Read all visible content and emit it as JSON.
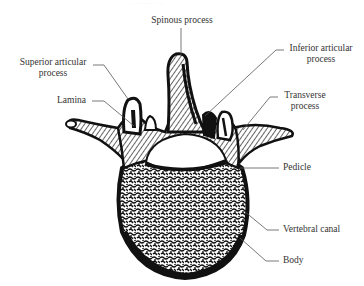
{
  "figure": {
    "faint_caption": "· · · · · · · · · · · ·",
    "labels": {
      "spinous_process": "Spinous process",
      "superior_articular_line1": "Superior articular",
      "superior_articular_line2": "process",
      "lamina": "Lamina",
      "inferior_articular_line1": "Inferior articular",
      "inferior_articular_line2": "process",
      "transverse_line1": "Transverse",
      "transverse_line2": "process",
      "pedicle": "Pedicle",
      "vertebral_canal": "Vertebral canal",
      "body": "Body"
    },
    "colors": {
      "ink": "#111111",
      "leader": "#555555",
      "text": "#333333",
      "background": "#ffffff"
    }
  }
}
